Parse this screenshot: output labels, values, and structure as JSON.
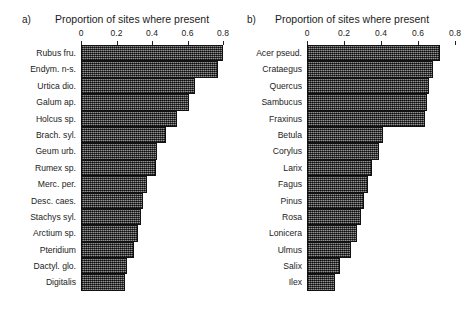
{
  "figure": {
    "panels": [
      {
        "tag": "a)",
        "axis_title": "Proportion of sites where present"
      },
      {
        "tag": "b)",
        "axis_title": "Proportion of sites where present"
      }
    ]
  },
  "chart_data": [
    {
      "type": "bar",
      "orientation": "horizontal",
      "panel": "a)",
      "title": "Proportion of sites where present",
      "xlabel": "Proportion of sites where present",
      "ylabel": "",
      "xlim": [
        0,
        0.8
      ],
      "xticks": [
        0,
        0.2,
        0.4,
        0.6,
        0.8
      ],
      "xticklabels": [
        "0",
        "0.2",
        "0.4",
        "0.6",
        "0.8"
      ],
      "grid": false,
      "legend": false,
      "bar_fill": "#4a4a4a",
      "bar_edge": "#111111",
      "categories": [
        "Rubus fru.",
        "Endym. n-s.",
        "Urtica dio.",
        "Galum ap.",
        "Holcus sp.",
        "Brach. syl.",
        "Geum urb.",
        "Rumex sp.",
        "Merc. per.",
        "Desc. caes.",
        "Stachys syl.",
        "Arctium sp.",
        "Pteridium",
        "Dactyl. glo.",
        "Digitalis"
      ],
      "values": [
        0.8,
        0.77,
        0.64,
        0.61,
        0.54,
        0.48,
        0.43,
        0.42,
        0.37,
        0.35,
        0.34,
        0.32,
        0.3,
        0.26,
        0.25
      ]
    },
    {
      "type": "bar",
      "orientation": "horizontal",
      "panel": "b)",
      "title": "Proportion of sites where present",
      "xlabel": "Proportion of sites where present",
      "ylabel": "",
      "xlim": [
        0,
        0.8
      ],
      "xticks": [
        0,
        0.2,
        0.4,
        0.6,
        0.8
      ],
      "xticklabels": [
        "0",
        "0.2",
        "0.4",
        "0.6",
        "0.8"
      ],
      "grid": false,
      "legend": false,
      "bar_fill": "#4a4a4a",
      "bar_edge": "#111111",
      "categories": [
        "Acer pseud.",
        "Crataegus",
        "Quercus",
        "Sambucus",
        "Fraxinus",
        "Betula",
        "Corylus",
        "Larix",
        "Fagus",
        "Pinus",
        "Rosa",
        "Lonicera",
        "Ulmus",
        "Salix",
        "Ilex"
      ],
      "values": [
        0.72,
        0.68,
        0.66,
        0.65,
        0.64,
        0.41,
        0.39,
        0.35,
        0.33,
        0.31,
        0.29,
        0.27,
        0.24,
        0.18,
        0.15
      ]
    }
  ]
}
